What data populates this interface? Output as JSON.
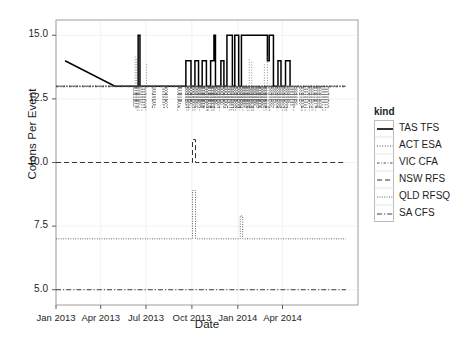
{
  "chart_data": {
    "type": "line",
    "title": "",
    "xlabel": "Date",
    "ylabel": "Colons Per Event",
    "grid": true,
    "legend_position": "right",
    "legend_title": "kind",
    "xlim": [
      "2012-11-15",
      "2014-06-20"
    ],
    "ylim": [
      4.4,
      15.6
    ],
    "yticks": [
      "5.0",
      "7.5",
      "10.0",
      "12.5",
      "15.0"
    ],
    "ytick_values": [
      5.0,
      7.5,
      10.0,
      12.5,
      15.0
    ],
    "xticks": [
      "Jan 2013",
      "Apr 2013",
      "Jul 2013",
      "Oct 2013",
      "Jan 2014",
      "Apr 2014"
    ],
    "xtick_values": [
      0.0,
      0.148,
      0.298,
      0.45,
      0.602,
      0.75
    ],
    "series": [
      {
        "name": "TAS TFS",
        "dash": "solid",
        "color": "#000000",
        "points": [
          [
            0.03,
            14.0
          ],
          [
            0.195,
            13.0
          ],
          [
            0.272,
            13.0
          ],
          [
            0.272,
            15.0
          ],
          [
            0.278,
            15.0
          ],
          [
            0.278,
            13.0
          ],
          [
            0.43,
            13.0
          ],
          [
            0.43,
            14.0
          ],
          [
            0.447,
            14.0
          ],
          [
            0.447,
            13.0
          ],
          [
            0.46,
            13.0
          ],
          [
            0.46,
            14.0
          ],
          [
            0.472,
            14.0
          ],
          [
            0.472,
            13.0
          ],
          [
            0.484,
            13.0
          ],
          [
            0.484,
            14.0
          ],
          [
            0.498,
            14.0
          ],
          [
            0.498,
            13.0
          ],
          [
            0.512,
            13.0
          ],
          [
            0.512,
            14.0
          ],
          [
            0.523,
            14.0
          ],
          [
            0.523,
            15.0
          ],
          [
            0.528,
            15.0
          ],
          [
            0.528,
            13.0
          ],
          [
            0.546,
            13.0
          ],
          [
            0.546,
            14.0
          ],
          [
            0.556,
            14.0
          ],
          [
            0.556,
            13.0
          ],
          [
            0.566,
            13.0
          ],
          [
            0.566,
            15.0
          ],
          [
            0.584,
            15.0
          ],
          [
            0.584,
            13.0
          ],
          [
            0.592,
            13.0
          ],
          [
            0.592,
            15.0
          ],
          [
            0.605,
            15.0
          ],
          [
            0.605,
            13.0
          ],
          [
            0.614,
            13.0
          ],
          [
            0.614,
            15.0
          ],
          [
            0.7,
            15.0
          ],
          [
            0.7,
            14.0
          ],
          [
            0.706,
            14.0
          ],
          [
            0.706,
            15.0
          ],
          [
            0.72,
            15.0
          ],
          [
            0.72,
            13.0
          ],
          [
            0.735,
            13.0
          ],
          [
            0.735,
            14.0
          ],
          [
            0.745,
            14.0
          ],
          [
            0.745,
            13.0
          ],
          [
            0.76,
            13.0
          ],
          [
            0.76,
            14.0
          ],
          [
            0.775,
            14.0
          ],
          [
            0.775,
            13.0
          ]
        ]
      },
      {
        "name": "ACT ESA",
        "dash": "dotted",
        "color": "#4d4d4d",
        "points": [
          [
            0.0,
            13.0
          ],
          [
            0.96,
            13.0
          ]
        ]
      },
      {
        "name": "VIC CFA",
        "dash": "dashdot-fine",
        "color": "#4d4d4d",
        "points": [
          [
            0.0,
            13.0
          ],
          [
            0.96,
            13.0
          ]
        ]
      },
      {
        "name": "NSW RFS",
        "dash": "dashed",
        "color": "#333333",
        "points": [
          [
            0.0,
            10.0
          ],
          [
            0.452,
            10.0
          ],
          [
            0.452,
            10.9
          ],
          [
            0.462,
            10.9
          ],
          [
            0.462,
            10.0
          ],
          [
            0.96,
            10.0
          ]
        ]
      },
      {
        "name": "QLD RFSQ",
        "dash": "fine-dotted",
        "color": "#555555",
        "points": [
          [
            0.0,
            7.0
          ],
          [
            0.452,
            7.0
          ],
          [
            0.452,
            8.9
          ],
          [
            0.462,
            8.9
          ],
          [
            0.462,
            7.0
          ],
          [
            0.61,
            7.0
          ],
          [
            0.61,
            7.9
          ],
          [
            0.618,
            7.9
          ],
          [
            0.618,
            7.0
          ],
          [
            0.96,
            7.0
          ]
        ]
      },
      {
        "name": "SA CFS",
        "dash": "dashdot",
        "color": "#3d3d3d",
        "points": [
          [
            0.0,
            5.0
          ],
          [
            0.96,
            5.0
          ]
        ]
      }
    ]
  },
  "legend": {
    "title": "kind",
    "entries": [
      {
        "label": "TAS TFS"
      },
      {
        "label": "ACT ESA"
      },
      {
        "label": "VIC CFA"
      },
      {
        "label": "NSW RFS"
      },
      {
        "label": "QLD RFSQ"
      },
      {
        "label": "SA CFS"
      }
    ]
  }
}
